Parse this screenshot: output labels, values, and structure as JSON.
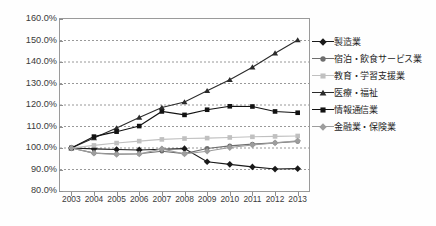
{
  "chart_data": {
    "type": "line",
    "title": "",
    "xlabel": "",
    "ylabel": "",
    "x": [
      "2003",
      "2004",
      "2005",
      "2006",
      "2007",
      "2008",
      "2009",
      "2010",
      "2011",
      "2012",
      "2013"
    ],
    "ylim": [
      80,
      160
    ],
    "ytick_step": 10,
    "ytick_labels": [
      "160.0%",
      "150.0%",
      "140.0%",
      "130.0%",
      "120.0%",
      "110.0%",
      "100.0%",
      "90.0%",
      "80.0%"
    ],
    "ytick_values": [
      160,
      150,
      140,
      130,
      120,
      110,
      100,
      90,
      80
    ],
    "grid": "horizontal-dotted",
    "legend_position": "right",
    "series": [
      {
        "name": "製造業",
        "marker": "diamond",
        "color": "#1a1a1a",
        "values": [
          100.0,
          99.6,
          99.3,
          99.1,
          99.4,
          99.7,
          93.6,
          92.4,
          91.2,
          90.2,
          90.4
        ]
      },
      {
        "name": "宿泊・飲食サービス業",
        "marker": "circle",
        "color": "#6e6e6e",
        "values": [
          100.0,
          97.6,
          97.2,
          97.3,
          98.5,
          97.4,
          99.8,
          101.0,
          101.8,
          102.4,
          103.0
        ]
      },
      {
        "name": "教育・学習支援業",
        "marker": "square",
        "color": "#c0c0c0",
        "values": [
          100.0,
          101.2,
          102.3,
          103.2,
          104.0,
          104.4,
          104.6,
          104.9,
          105.2,
          105.4,
          105.6
        ]
      },
      {
        "name": "医療・福祉",
        "marker": "triangle",
        "color": "#2b2b2b",
        "values": [
          100.0,
          104.6,
          109.3,
          114.2,
          118.8,
          121.4,
          126.6,
          131.7,
          137.6,
          144.1,
          150.2
        ]
      },
      {
        "name": "情報通信業",
        "marker": "square",
        "color": "#121212",
        "values": [
          100.0,
          105.3,
          107.6,
          110.2,
          117.0,
          115.4,
          117.8,
          119.4,
          119.3,
          117.0,
          116.4
        ]
      },
      {
        "name": "金融業・保険業",
        "marker": "diamond",
        "color": "#9d9d9d",
        "values": [
          100.0,
          97.6,
          97.0,
          97.2,
          99.6,
          97.2,
          98.5,
          100.2,
          101.4,
          102.4,
          103.4
        ]
      }
    ]
  },
  "legend": {
    "items": [
      {
        "label": "製造業"
      },
      {
        "label": "宿泊・飲食サービス業"
      },
      {
        "label": "教育・学習支援業"
      },
      {
        "label": "医療・福祉"
      },
      {
        "label": "情報通信業"
      },
      {
        "label": "金融業・保険業"
      }
    ]
  }
}
